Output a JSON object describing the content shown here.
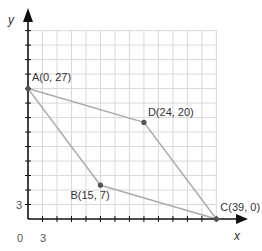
{
  "chart_data": {
    "type": "scatter",
    "title": "",
    "xlabel": "x",
    "ylabel": "y",
    "xlim": [
      0,
      39
    ],
    "ylim": [
      0,
      39
    ],
    "grid": true,
    "grid_step": 3,
    "tick_labels": {
      "origin": "0",
      "x": [
        "3"
      ],
      "y": [
        "3"
      ]
    },
    "points": [
      {
        "name": "A",
        "x": 0,
        "y": 27,
        "label": "A(0, 27)"
      },
      {
        "name": "B",
        "x": 15,
        "y": 7,
        "label": "B(15, 7)"
      },
      {
        "name": "C",
        "x": 39,
        "y": 0,
        "label": "C(39, 0)"
      },
      {
        "name": "D",
        "x": 24,
        "y": 20,
        "label": "D(24, 20)"
      }
    ],
    "segments": [
      [
        "A",
        "D"
      ],
      [
        "D",
        "C"
      ],
      [
        "A",
        "B"
      ],
      [
        "B",
        "C"
      ]
    ],
    "colors": {
      "grid": "#d9d9d9",
      "axis": "#111111",
      "segment": "#aaaaaa",
      "point": "#555555"
    }
  }
}
